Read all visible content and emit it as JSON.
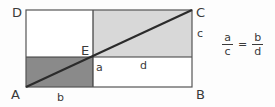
{
  "figure": {
    "type": "geometric-diagram",
    "vertices": [
      {
        "id": "D",
        "label": "D",
        "position": "top-left"
      },
      {
        "id": "C",
        "label": "C",
        "position": "top-right"
      },
      {
        "id": "A",
        "label": "A",
        "position": "bottom-left"
      },
      {
        "id": "B",
        "label": "B",
        "position": "bottom-right"
      },
      {
        "id": "E",
        "label": "E",
        "position": "center-intersection"
      }
    ],
    "segment_labels": [
      {
        "id": "a",
        "label": "a",
        "describes": "vertical segment from E down to AB"
      },
      {
        "id": "b",
        "label": "b",
        "describes": "horizontal segment from A to foot of E"
      },
      {
        "id": "c",
        "label": "c",
        "describes": "vertical segment from E level up to C"
      },
      {
        "id": "d",
        "label": "d",
        "describes": "horizontal segment from foot of E to B"
      }
    ],
    "quadrant_shading": {
      "top_left": "#ffffff",
      "top_right": "#d8d8d8",
      "bottom_left": "#8a8a8a",
      "bottom_right": "#ffffff"
    },
    "colors": {
      "outline": "#555555",
      "diagonal": "#2b2b2b",
      "divider": "#3a3a3a",
      "text": "#3a3a3a",
      "background": "#fdfdfd",
      "light_gray_fill": "#d8d8d8",
      "dark_gray_fill": "#8a8a8a"
    }
  },
  "formula": {
    "left": {
      "numerator": "a",
      "denominator": "c"
    },
    "equals": "=",
    "right": {
      "numerator": "b",
      "denominator": "d"
    },
    "plain": "a/c = b/d"
  }
}
